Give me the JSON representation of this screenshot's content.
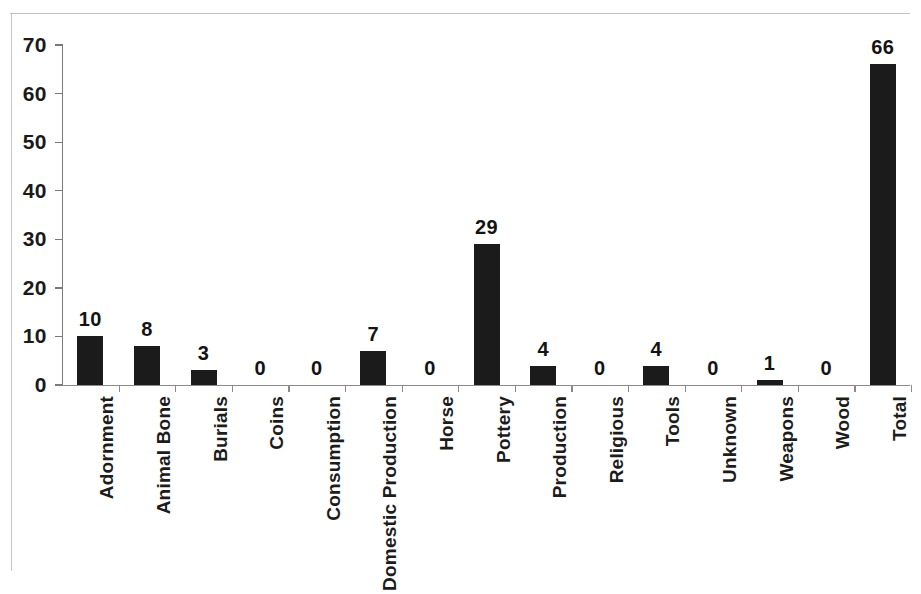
{
  "chart_data": {
    "type": "bar",
    "title": "",
    "subtitle": "",
    "xlabel": "",
    "ylabel": "",
    "ylim": [
      0,
      70
    ],
    "yticks": [
      0,
      10,
      20,
      30,
      40,
      50,
      60,
      70
    ],
    "grid": false,
    "legend": false,
    "bar_color": "#1b1b1b",
    "axis_color": "#7a7a7a",
    "show_value_labels": true,
    "categories": [
      "Adornment",
      "Animal Bone",
      "Burials",
      "Coins",
      "Consumption",
      "Domestic Production",
      "Horse",
      "Pottery",
      "Production",
      "Religious",
      "Tools",
      "Unknown",
      "Weapons",
      "Wood",
      "Total"
    ],
    "values": [
      10,
      8,
      3,
      0,
      0,
      7,
      0,
      29,
      4,
      0,
      4,
      0,
      1,
      0,
      66
    ],
    "value_labels": [
      "10",
      "8",
      "3",
      "0",
      "0",
      "7",
      "0",
      "29",
      "4",
      "0",
      "4",
      "0",
      "1",
      "0",
      "66"
    ],
    "ytick_labels": [
      "0",
      "10",
      "20",
      "30",
      "40",
      "50",
      "60",
      "70"
    ]
  }
}
